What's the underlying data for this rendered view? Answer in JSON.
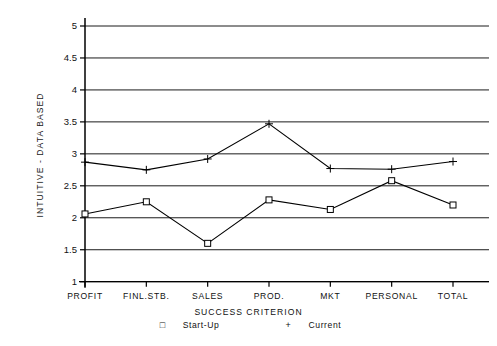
{
  "chart_data": {
    "type": "line",
    "title": "",
    "xlabel": "SUCCESS CRITERION",
    "ylabel": "INTUITIVE - DATA BASED",
    "categories": [
      "PROFIT",
      "FINL.STB.",
      "SALES",
      "PROD.",
      "MKT",
      "PERSONAL",
      "TOTAL"
    ],
    "series": [
      {
        "name": "Start-Up",
        "marker": "square",
        "values": [
          2.06,
          2.25,
          1.6,
          2.28,
          2.13,
          2.58,
          2.2
        ]
      },
      {
        "name": "Current",
        "marker": "plus",
        "values": [
          2.87,
          2.75,
          2.92,
          3.47,
          2.77,
          2.76,
          2.88
        ]
      }
    ],
    "ylim": [
      1,
      5
    ],
    "yticks": [
      1,
      1.5,
      2,
      2.5,
      3,
      3.5,
      4,
      4.5,
      5
    ],
    "ytick_labels": [
      "1",
      "1.5",
      "2",
      "2.5",
      "3",
      "3.5",
      "4",
      "4.5",
      "5"
    ],
    "grid": true,
    "grid_axis": "y",
    "legend_position": "bottom",
    "line_color": "#000000",
    "grid_color": "#000000",
    "background": "#ffffff"
  },
  "legend": {
    "startup_marker": "□",
    "startup_label": "Start-Up",
    "current_marker": "+",
    "current_label": "Current"
  }
}
